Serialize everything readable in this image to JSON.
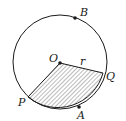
{
  "diagram": {
    "type": "circle-sector",
    "labels": {
      "center": "O",
      "radius": "r",
      "point_b": "B",
      "point_q": "Q",
      "point_p": "P",
      "point_a": "A"
    },
    "colors": {
      "stroke": "#1a1a1a",
      "hatch": "#555555",
      "background": "#ffffff"
    }
  }
}
